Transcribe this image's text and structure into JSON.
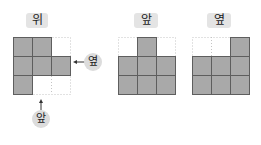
{
  "views": [
    {
      "id": "top",
      "label": "위",
      "grid": [
        [
          1,
          1,
          0
        ],
        [
          1,
          1,
          1
        ],
        [
          1,
          0,
          0
        ]
      ]
    },
    {
      "id": "front",
      "label": "앞",
      "grid": [
        [
          0,
          1,
          0
        ],
        [
          1,
          1,
          1
        ],
        [
          1,
          1,
          1
        ]
      ]
    },
    {
      "id": "side",
      "label": "옆",
      "grid": [
        [
          0,
          0,
          1
        ],
        [
          1,
          1,
          1
        ],
        [
          1,
          1,
          1
        ]
      ]
    }
  ],
  "annotations": {
    "side_direction": "옆",
    "front_direction": "앞"
  },
  "colors": {
    "fill": "#a9a9a9",
    "border": "#5e5e5e",
    "dotted": "#c4c4c4",
    "tag_bg": "#e4e4e4"
  }
}
